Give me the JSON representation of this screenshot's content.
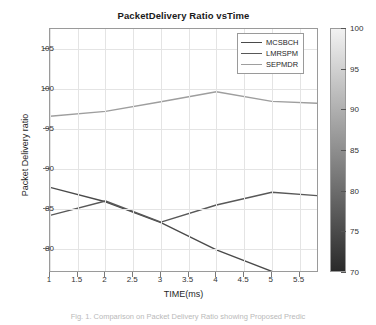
{
  "chart_data": {
    "type": "line",
    "title": "PacketDelivery Ratio vsTime",
    "xlabel": "TIME(ms)",
    "ylabel": "Packet Delivery ratio",
    "xlim": [
      1,
      5.85
    ],
    "ylim": [
      77.0,
      107.5
    ],
    "grid": true,
    "legend_position": "top-right",
    "xticks": [
      "1",
      "1.5",
      "2",
      "2.5",
      "3",
      "3.5",
      "4",
      "4.5",
      "5",
      "5.5"
    ],
    "xtick_values": [
      1,
      1.5,
      2,
      2.5,
      3,
      3.5,
      4,
      4.5,
      5,
      5.5
    ],
    "yticks": [
      "80",
      "85",
      "90",
      "95",
      "100",
      "105"
    ],
    "ytick_values": [
      80,
      85,
      90,
      95,
      100,
      105
    ],
    "x": [
      1,
      2,
      3,
      4,
      5,
      5.85
    ],
    "series": [
      {
        "name": "MCSBCH",
        "color": "#4a4a4a",
        "values": [
          87.7,
          85.9,
          83.3,
          79.9,
          77.2,
          77.0
        ]
      },
      {
        "name": "LMRSPM",
        "color": "#585858",
        "values": [
          84.2,
          86.0,
          83.35,
          85.5,
          87.1,
          86.65
        ]
      },
      {
        "name": "SEPMDR",
        "color": "#9e9e9e",
        "values": [
          96.6,
          97.2,
          98.4,
          99.65,
          98.45,
          98.2
        ]
      }
    ]
  },
  "legend": {
    "items": [
      {
        "label": "MCSBCH",
        "color": "#4a4a4a"
      },
      {
        "label": "LMRSPM",
        "color": "#585858"
      },
      {
        "label": "SEPMDR",
        "color": "#9e9e9e"
      }
    ]
  },
  "colorbar": {
    "min": 70,
    "max": 100,
    "ticks": [
      "70",
      "75",
      "80",
      "85",
      "90",
      "95",
      "100"
    ],
    "tick_values": [
      70,
      75,
      80,
      85,
      90,
      95,
      100
    ],
    "gradient_low_color": "#2a2a2a",
    "gradient_high_color": "#f2f2f2"
  },
  "caption": "Fig. 1. Comparison on Packet Delivery Ratio showing Proposed Predic"
}
